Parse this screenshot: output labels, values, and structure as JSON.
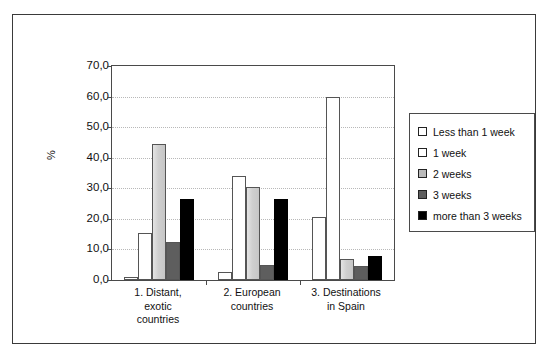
{
  "chart_data": {
    "type": "bar",
    "title": "",
    "xlabel": "",
    "ylabel": "%",
    "ylim": [
      0,
      70
    ],
    "ytick_labels": [
      "70,0",
      "60,0",
      "50,0",
      "40,0",
      "30,0",
      "20,0",
      "10,0",
      "0,0"
    ],
    "ytick_values": [
      70,
      60,
      50,
      40,
      30,
      20,
      10,
      0
    ],
    "grid": true,
    "legend_position": "right",
    "categories": [
      "1. Distant, exotic countries",
      "2. European countries",
      "3. Destinations in Spain"
    ],
    "category_label_lines": [
      [
        "1. Distant,",
        "exotic",
        "countries"
      ],
      [
        "2. European",
        "countries"
      ],
      [
        "3. Destinations",
        "in Spain"
      ]
    ],
    "series": [
      {
        "name": "Less than 1 week",
        "color": "#ffffff",
        "values": [
          1.0,
          2.5,
          20.5
        ]
      },
      {
        "name": "1 week",
        "color": "#ffffff",
        "values": [
          15.5,
          34.0,
          59.8
        ]
      },
      {
        "name": "2 weeks",
        "color": "#d0d0d0",
        "values": [
          44.5,
          30.5,
          7.0
        ]
      },
      {
        "name": "3 weeks",
        "color": "#5e5e5e",
        "values": [
          12.5,
          5.0,
          4.5
        ]
      },
      {
        "name": "more than 3 weeks",
        "color": "#000000",
        "values": [
          26.5,
          26.5,
          8.0
        ]
      }
    ]
  },
  "legend": {
    "items": [
      {
        "label": "Less than 1 week",
        "color": "#ffffff"
      },
      {
        "label": "1 week",
        "color": "#ffffff"
      },
      {
        "label": "2 weeks",
        "color": "#b9b9b9"
      },
      {
        "label": "3 weeks",
        "color": "#5e5e5e"
      },
      {
        "label": "more than 3 weeks",
        "color": "#000000"
      }
    ]
  },
  "caption": ""
}
